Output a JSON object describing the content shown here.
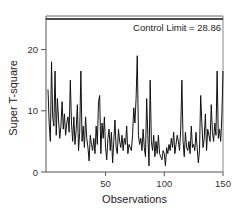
{
  "chart_data": {
    "type": "line",
    "title": "",
    "xlabel": "Observations",
    "ylabel": "Super T-square",
    "xlim": [
      1,
      150
    ],
    "ylim": [
      0,
      25.5
    ],
    "x_ticks": [
      50,
      100,
      150
    ],
    "y_ticks": [
      0,
      10,
      20
    ],
    "grid": false,
    "legend": "none",
    "control_limit": {
      "value": 28.86,
      "label": "Control Limit = 28.86"
    },
    "series": [
      {
        "name": "Super T-square",
        "color": "#111111",
        "values": [
          13.5,
          8.0,
          5.0,
          18.0,
          9.0,
          7.5,
          16.5,
          6.0,
          12.0,
          8.5,
          5.5,
          7.5,
          11.5,
          7.0,
          9.5,
          6.0,
          8.0,
          9.0,
          6.5,
          15.0,
          8.0,
          5.0,
          9.0,
          4.5,
          7.0,
          11.0,
          3.5,
          6.5,
          16.5,
          5.0,
          7.5,
          4.0,
          9.0,
          5.5,
          4.0,
          1.8,
          6.0,
          4.5,
          3.5,
          5.5,
          3.0,
          7.5,
          4.5,
          11.5,
          12.5,
          3.0,
          8.0,
          5.5,
          9.0,
          4.0,
          2.0,
          5.5,
          7.0,
          3.5,
          6.5,
          1.5,
          5.0,
          8.5,
          4.0,
          3.0,
          7.0,
          5.0,
          4.0,
          6.0,
          3.5,
          5.5,
          4.5,
          7.5,
          3.0,
          4.5,
          4.0,
          3.5,
          6.0,
          10.5,
          8.0,
          12.0,
          19.0,
          6.0,
          4.5,
          5.5,
          3.5,
          7.0,
          4.0,
          2.5,
          12.0,
          6.0,
          1.0,
          15.0,
          5.0,
          3.5,
          6.0,
          2.5,
          5.0,
          3.0,
          6.0,
          3.0,
          2.5,
          2.0,
          3.5,
          3.0,
          1.0,
          4.0,
          3.0,
          4.5,
          3.5,
          5.5,
          4.0,
          6.5,
          3.0,
          4.5,
          6.0,
          5.0,
          3.5,
          7.0,
          15.0,
          5.0,
          2.5,
          6.5,
          4.0,
          3.5,
          5.0,
          3.0,
          7.5,
          4.0,
          4.5,
          3.5,
          6.5,
          4.0,
          1.5,
          3.5,
          12.5,
          8.0,
          4.0,
          5.5,
          9.5,
          3.5,
          7.0,
          6.0,
          5.0,
          11.0,
          6.5,
          5.0,
          8.0,
          6.0,
          16.5,
          5.5,
          7.0,
          5.0,
          9.0,
          16.5
        ]
      }
    ]
  }
}
